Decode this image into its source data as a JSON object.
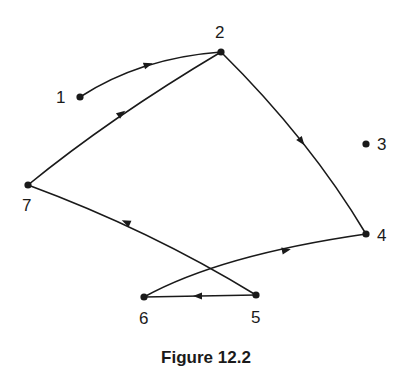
{
  "figure": {
    "caption": "Figure 12.2",
    "type": "directed graph",
    "nodes": [
      {
        "id": "1",
        "label": "1",
        "x": 80,
        "y": 97
      },
      {
        "id": "2",
        "label": "2",
        "x": 221,
        "y": 52
      },
      {
        "id": "3",
        "label": "3",
        "x": 366,
        "y": 144
      },
      {
        "id": "4",
        "label": "4",
        "x": 366,
        "y": 234
      },
      {
        "id": "5",
        "label": "5",
        "x": 256,
        "y": 295
      },
      {
        "id": "6",
        "label": "6",
        "x": 144,
        "y": 297
      },
      {
        "id": "7",
        "label": "7",
        "x": 28,
        "y": 185
      }
    ],
    "edges": [
      {
        "from": "1",
        "to": "2",
        "curved": true
      },
      {
        "from": "7",
        "to": "2",
        "curved": false
      },
      {
        "from": "2",
        "to": "4",
        "curved": true
      },
      {
        "from": "6",
        "to": "4",
        "curved": false
      },
      {
        "from": "5",
        "to": "7",
        "curved": false
      },
      {
        "from": "5",
        "to": "6",
        "curved": false
      }
    ]
  },
  "labels": {
    "n1": "1",
    "n2": "2",
    "n3": "3",
    "n4": "4",
    "n5": "5",
    "n6": "6",
    "n7": "7"
  }
}
